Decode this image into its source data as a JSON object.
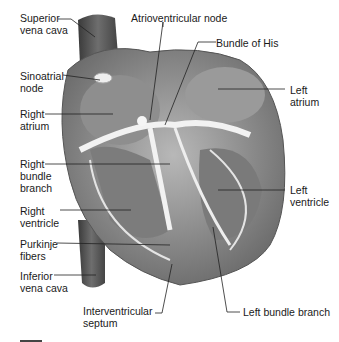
{
  "diagram": {
    "type": "anatomical-illustration",
    "labels": [
      {
        "id": "superior-vena-cava",
        "line1": "Superior",
        "line2": "vena cava",
        "x": 20,
        "y": 12
      },
      {
        "id": "atrioventricular-node",
        "line1": "Atrioventricular node",
        "line2": "",
        "x": 131,
        "y": 13
      },
      {
        "id": "bundle-of-his",
        "line1": "Bundle of His",
        "line2": "",
        "x": 216,
        "y": 37
      },
      {
        "id": "sinoatrial-node",
        "line1": "Sinoatrial",
        "line2": "node",
        "x": 20,
        "y": 70
      },
      {
        "id": "left-atrium",
        "line1": "Left",
        "line2": "atrium",
        "x": 290,
        "y": 82
      },
      {
        "id": "right-atrium",
        "line1": "Right",
        "line2": "atrium",
        "x": 20,
        "y": 107
      },
      {
        "id": "right-bundle-branch",
        "line1": "Right",
        "line2": "bundle",
        "line3": "branch",
        "x": 20,
        "y": 158
      },
      {
        "id": "left-ventricle",
        "line1": "Left",
        "line2": "ventricle",
        "x": 290,
        "y": 185
      },
      {
        "id": "right-ventricle",
        "line1": "Right",
        "line2": "ventricle",
        "x": 20,
        "y": 206
      },
      {
        "id": "purkinje-fibers",
        "line1": "Purkinje",
        "line2": "fibers",
        "x": 20,
        "y": 238
      },
      {
        "id": "inferior-vena-cava",
        "line1": "Inferior",
        "line2": "vena cava",
        "x": 20,
        "y": 270
      },
      {
        "id": "interventricular-septum",
        "line1": "Interventricular",
        "line2": "septum",
        "x": 83,
        "y": 305
      },
      {
        "id": "left-bundle-branch",
        "line1": "Left bundle branch",
        "line2": "",
        "x": 243,
        "y": 305
      }
    ]
  }
}
